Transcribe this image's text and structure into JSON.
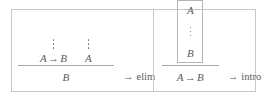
{
  "figure": {
    "caption": "",
    "panels": [
      {
        "name": "implication-elimination",
        "rule_label": "elim",
        "rule_label_arrow": "→",
        "premises": [
          {
            "formula_left": "A",
            "operator": "→",
            "formula_right": "B",
            "has_vdots": true
          },
          {
            "formula_left": "A",
            "operator": "",
            "formula_right": "",
            "has_vdots": true
          }
        ],
        "conclusion": "B"
      },
      {
        "name": "implication-introduction",
        "rule_label": "intro",
        "rule_label_arrow": "→",
        "subproof": {
          "assumption": "A",
          "has_vdots": true,
          "result": "B"
        },
        "conclusion_left": "A",
        "conclusion_operator": "→",
        "conclusion_right": "B"
      }
    ]
  },
  "style": {
    "border_color": "#c8c8c8",
    "rule_line_color": "#a9a9a9",
    "text_color": "#5a5a5a",
    "background": "#ffffff"
  }
}
